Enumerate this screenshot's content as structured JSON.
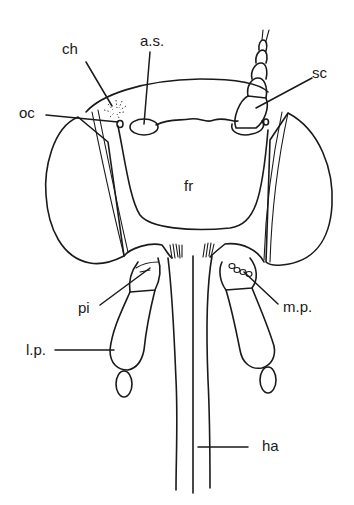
{
  "figure": {
    "line_color": "#1a1a1a",
    "background": "#ffffff"
  },
  "labels": {
    "ch": "ch",
    "as": "a.s.",
    "sc": "sc",
    "oc": "oc",
    "fr": "fr",
    "pi": "pi",
    "mp": "m.p.",
    "lp": "l.p.",
    "ha": "ha"
  }
}
